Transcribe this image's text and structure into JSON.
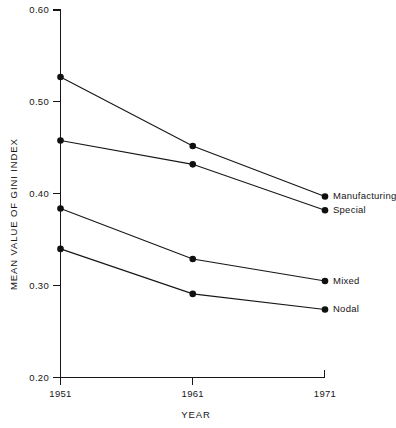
{
  "chart_data": {
    "type": "line",
    "title": "",
    "xlabel": "YEAR",
    "ylabel": "MEAN VALUE OF GINI INDEX",
    "categories": [
      "1951",
      "1961",
      "1971"
    ],
    "x": [
      1951,
      1961,
      1971
    ],
    "xlim": [
      1951,
      1971
    ],
    "ylim": [
      0.2,
      0.6
    ],
    "yticks": [
      "0.60",
      "0.50",
      "0.40",
      "0.30",
      "0.20"
    ],
    "ytick_values": [
      0.6,
      0.5,
      0.4,
      0.3,
      0.2
    ],
    "xticks": [
      "1951",
      "1961",
      "1971"
    ],
    "grid": false,
    "legend_position": "right-inline-end-of-line",
    "marker": "filled-circle",
    "line_color": "#161616",
    "marker_color": "#101010",
    "background_color": "#ffffff",
    "series": [
      {
        "name": "Manufacturing",
        "values": [
          0.527,
          0.452,
          0.397
        ]
      },
      {
        "name": "Special",
        "values": [
          0.458,
          0.432,
          0.382
        ]
      },
      {
        "name": "Mixed",
        "values": [
          0.384,
          0.329,
          0.305
        ]
      },
      {
        "name": "Nodal",
        "values": [
          0.34,
          0.291,
          0.274
        ]
      }
    ]
  },
  "axes": {
    "y_title": "MEAN VALUE OF GINI INDEX",
    "x_title": "YEAR"
  }
}
